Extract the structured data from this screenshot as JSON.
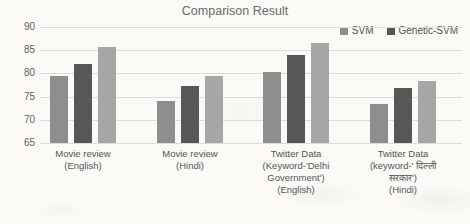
{
  "title": "Comparison Result",
  "legend": [
    {
      "label": "SVM",
      "color": "#8e8e8e"
    },
    {
      "label": "Genetic-SVM",
      "color": "#575757"
    }
  ],
  "chart_data": {
    "type": "bar",
    "title": "Comparison Result",
    "categories": [
      "Movie review\n(English)",
      "Movie review\n(Hindi)",
      "Twitter Data\n(Keyword-'Delhi\nGovernment')\n(English)",
      "Twitter Data\n(keyword-' दिल्ली\nसरकार')\n(Hindi)"
    ],
    "series": [
      {
        "name": "SVM",
        "color": "#8e8e8e",
        "values": [
          79.5,
          74.0,
          80.3,
          73.5
        ]
      },
      {
        "name": "Genetic-SVM",
        "color": "#575757",
        "values": [
          82.1,
          77.2,
          84.0,
          76.8
        ]
      },
      {
        "name": "",
        "color": "#a6a6a6",
        "values": [
          85.6,
          79.5,
          86.5,
          78.4
        ]
      }
    ],
    "xlabel": "",
    "ylabel": "",
    "ylim": [
      65,
      90
    ],
    "yticks": [
      90,
      85,
      80,
      75,
      70,
      65
    ],
    "grid": true,
    "legend_position": "top-right"
  }
}
